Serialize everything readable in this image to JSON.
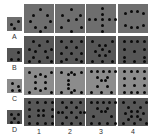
{
  "row_labels": [
    "A",
    "B",
    "C",
    "D"
  ],
  "col_labels": [
    "1",
    "2",
    "3",
    "4"
  ],
  "colors": {
    "A": "#6e6e6e",
    "B": "#565656",
    "C": "#8c8c8c",
    "D": "#575757"
  },
  "rows": [
    {
      "label": "A",
      "sample_dots": [
        [
          3,
          6
        ],
        [
          10,
          3
        ],
        [
          6,
          10
        ]
      ],
      "cells": [
        [
          [
            15,
            4
          ],
          [
            8,
            10
          ],
          [
            22,
            10
          ],
          [
            5,
            16
          ],
          [
            25,
            16
          ],
          [
            10,
            22
          ],
          [
            20,
            22
          ],
          [
            15,
            26
          ]
        ],
        [
          [
            15,
            4
          ],
          [
            6,
            10
          ],
          [
            24,
            10
          ],
          [
            12,
            15
          ],
          [
            20,
            14
          ],
          [
            5,
            22
          ],
          [
            25,
            22
          ],
          [
            15,
            26
          ]
        ],
        [
          [
            15,
            3
          ],
          [
            8,
            14
          ],
          [
            15,
            9
          ],
          [
            15,
            14
          ],
          [
            22,
            14
          ],
          [
            2,
            14
          ],
          [
            28,
            14
          ],
          [
            15,
            20
          ],
          [
            15,
            26
          ]
        ],
        [
          [
            6,
            8
          ],
          [
            12,
            6
          ],
          [
            18,
            6
          ],
          [
            24,
            8
          ],
          [
            6,
            20
          ],
          [
            12,
            22
          ],
          [
            18,
            22
          ],
          [
            24,
            20
          ]
        ]
      ]
    },
    {
      "label": "B",
      "sample_dots": [
        [
          10,
          3
        ],
        [
          3,
          10
        ],
        [
          10,
          10
        ]
      ],
      "cells": [
        [
          [
            8,
            4
          ],
          [
            22,
            4
          ],
          [
            14,
            8
          ],
          [
            4,
            12
          ],
          [
            26,
            12
          ],
          [
            10,
            14
          ],
          [
            20,
            14
          ],
          [
            8,
            20
          ],
          [
            22,
            20
          ],
          [
            4,
            24
          ],
          [
            14,
            24
          ],
          [
            26,
            24
          ]
        ],
        [
          [
            5,
            4
          ],
          [
            15,
            4
          ],
          [
            25,
            4
          ],
          [
            10,
            10
          ],
          [
            20,
            10
          ],
          [
            5,
            16
          ],
          [
            15,
            16
          ],
          [
            25,
            16
          ],
          [
            10,
            22
          ],
          [
            20,
            22
          ],
          [
            5,
            24
          ],
          [
            25,
            24
          ]
        ],
        [
          [
            5,
            4
          ],
          [
            25,
            4
          ],
          [
            12,
            8
          ],
          [
            18,
            8
          ],
          [
            8,
            14
          ],
          [
            15,
            12
          ],
          [
            22,
            14
          ],
          [
            12,
            18
          ],
          [
            18,
            18
          ],
          [
            5,
            24
          ],
          [
            15,
            24
          ],
          [
            25,
            24
          ]
        ],
        [
          [
            5,
            4
          ],
          [
            12,
            4
          ],
          [
            18,
            4
          ],
          [
            25,
            4
          ],
          [
            5,
            12
          ],
          [
            25,
            12
          ],
          [
            15,
            14
          ],
          [
            5,
            20
          ],
          [
            25,
            20
          ],
          [
            5,
            24
          ],
          [
            15,
            24
          ],
          [
            25,
            24
          ]
        ]
      ]
    },
    {
      "label": "C",
      "sample_dots": [
        [
          4,
          3
        ],
        [
          10,
          6
        ],
        [
          4,
          10
        ],
        [
          11,
          10
        ]
      ],
      "cells": [
        [
          [
            4,
            4
          ],
          [
            26,
            4
          ],
          [
            10,
            8
          ],
          [
            15,
            6
          ],
          [
            20,
            8
          ],
          [
            10,
            14
          ],
          [
            20,
            14
          ],
          [
            10,
            20
          ],
          [
            15,
            22
          ],
          [
            20,
            20
          ],
          [
            4,
            24
          ],
          [
            26,
            24
          ]
        ],
        [
          [
            5,
            4
          ],
          [
            15,
            4
          ],
          [
            25,
            4
          ],
          [
            12,
            6
          ],
          [
            18,
            6
          ],
          [
            12,
            12
          ],
          [
            12,
            16
          ],
          [
            12,
            20
          ],
          [
            5,
            24
          ],
          [
            15,
            24
          ],
          [
            25,
            24
          ],
          [
            18,
            22
          ]
        ],
        [
          [
            4,
            3
          ],
          [
            10,
            3
          ],
          [
            16,
            3
          ],
          [
            22,
            3
          ],
          [
            28,
            3
          ],
          [
            10,
            9
          ],
          [
            20,
            9
          ],
          [
            14,
            12
          ],
          [
            18,
            12
          ],
          [
            10,
            18
          ],
          [
            20,
            18
          ],
          [
            4,
            24
          ],
          [
            14,
            24
          ],
          [
            24,
            24
          ]
        ],
        [
          [
            5,
            3
          ],
          [
            12,
            3
          ],
          [
            18,
            3
          ],
          [
            25,
            3
          ],
          [
            5,
            10
          ],
          [
            15,
            10
          ],
          [
            25,
            10
          ],
          [
            5,
            17
          ],
          [
            15,
            17
          ],
          [
            25,
            17
          ],
          [
            5,
            24
          ],
          [
            12,
            24
          ],
          [
            18,
            24
          ],
          [
            25,
            24
          ]
        ]
      ]
    },
    {
      "label": "D",
      "sample_dots": [
        [
          3,
          3
        ],
        [
          10,
          3
        ],
        [
          6,
          7
        ],
        [
          3,
          11
        ],
        [
          10,
          11
        ]
      ],
      "cells": [
        [
          [
            4,
            3
          ],
          [
            12,
            3
          ],
          [
            20,
            3
          ],
          [
            27,
            3
          ],
          [
            4,
            10
          ],
          [
            27,
            10
          ],
          [
            13,
            11
          ],
          [
            18,
            11
          ],
          [
            13,
            16
          ],
          [
            18,
            16
          ],
          [
            4,
            17
          ],
          [
            27,
            17
          ],
          [
            4,
            24
          ],
          [
            12,
            24
          ],
          [
            20,
            24
          ],
          [
            27,
            24
          ]
        ],
        [
          [
            6,
            3
          ],
          [
            15,
            3
          ],
          [
            24,
            3
          ],
          [
            10,
            8
          ],
          [
            20,
            8
          ],
          [
            6,
            13
          ],
          [
            24,
            13
          ],
          [
            15,
            13
          ],
          [
            10,
            18
          ],
          [
            20,
            18
          ],
          [
            6,
            24
          ],
          [
            15,
            24
          ],
          [
            24,
            24
          ],
          [
            2,
            13
          ],
          [
            28,
            13
          ]
        ],
        [
          [
            4,
            3
          ],
          [
            10,
            3
          ],
          [
            16,
            3
          ],
          [
            22,
            3
          ],
          [
            28,
            3
          ],
          [
            10,
            9
          ],
          [
            20,
            9
          ],
          [
            14,
            12
          ],
          [
            18,
            12
          ],
          [
            6,
            17
          ],
          [
            24,
            17
          ],
          [
            4,
            24
          ],
          [
            12,
            24
          ],
          [
            20,
            24
          ],
          [
            28,
            24
          ]
        ],
        [
          [
            4,
            3
          ],
          [
            15,
            3
          ],
          [
            27,
            3
          ],
          [
            9,
            8
          ],
          [
            21,
            8
          ],
          [
            12,
            12
          ],
          [
            18,
            12
          ],
          [
            6,
            14
          ],
          [
            24,
            14
          ],
          [
            12,
            17
          ],
          [
            18,
            17
          ],
          [
            9,
            20
          ],
          [
            21,
            20
          ],
          [
            4,
            24
          ],
          [
            15,
            24
          ],
          [
            27,
            24
          ]
        ]
      ]
    }
  ]
}
